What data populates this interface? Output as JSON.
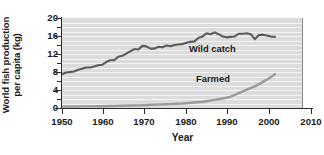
{
  "axes": {
    "ylabel_line1": "World fish production",
    "ylabel_line2": "per capita (kg)",
    "xlabel": "Year",
    "yticks": [
      0,
      4,
      8,
      12,
      16,
      20
    ],
    "xticks": [
      1950,
      1960,
      1970,
      1980,
      1990,
      2000,
      2010
    ]
  },
  "annotations": {
    "wild": "Wild catch",
    "farmed": "Farmed"
  },
  "colors": {
    "plot_background": "#dcdcdc",
    "gridline": "#f4f4f4",
    "wild_catch_line": "#5a5a5a",
    "farmed_line": "#9a9a9a",
    "axis": "#2b2b2b",
    "text": "#1a1a1a"
  },
  "chart_data": {
    "type": "line",
    "title": "",
    "xlabel": "Year",
    "ylabel": "World fish production per capita (kg)",
    "xlim": [
      1950,
      2010
    ],
    "ylim": [
      0,
      20
    ],
    "xticks": [
      1950,
      1960,
      1970,
      1980,
      1990,
      2000,
      2010
    ],
    "yticks": [
      0,
      4,
      8,
      12,
      16,
      20
    ],
    "grid": "horizontal gridlines every 1 kg, white on gray panel",
    "legend": "inline annotations next to each curve",
    "units": "kg per capita per year",
    "series": [
      {
        "name": "Wild catch",
        "color": "#5a5a5a",
        "label_position": "inside-right-center",
        "x": [
          1950,
          1951,
          1952,
          1953,
          1954,
          1955,
          1956,
          1957,
          1958,
          1959,
          1960,
          1961,
          1962,
          1963,
          1964,
          1965,
          1966,
          1967,
          1968,
          1969,
          1970,
          1971,
          1972,
          1973,
          1974,
          1975,
          1976,
          1977,
          1978,
          1979,
          1980,
          1981,
          1982,
          1983,
          1984,
          1985,
          1986,
          1987,
          1988,
          1989,
          1990,
          1991,
          1992,
          1993,
          1994,
          1995,
          1996,
          1997,
          1998,
          1999,
          2000,
          2001,
          2002,
          2003
        ],
        "values": [
          7.5,
          7.9,
          8.0,
          8.1,
          8.5,
          8.7,
          9.0,
          9.0,
          9.2,
          9.5,
          9.6,
          10.2,
          10.6,
          10.6,
          11.4,
          11.6,
          12.1,
          12.6,
          13.1,
          13.0,
          13.8,
          13.7,
          13.2,
          13.2,
          13.6,
          13.5,
          13.9,
          13.7,
          14.0,
          14.1,
          14.2,
          14.5,
          14.7,
          14.8,
          15.6,
          15.9,
          16.6,
          16.4,
          16.8,
          16.4,
          15.9,
          15.7,
          15.8,
          15.9,
          16.5,
          16.5,
          16.6,
          16.4,
          15.3,
          16.2,
          16.3,
          16.1,
          15.9,
          15.8
        ]
      },
      {
        "name": "Farmed",
        "color": "#9a9a9a",
        "label_position": "above-curve-right",
        "x": [
          1950,
          1955,
          1960,
          1965,
          1970,
          1975,
          1980,
          1985,
          1988,
          1990,
          1992,
          1994,
          1996,
          1998,
          2000,
          2001,
          2002,
          2003
        ],
        "values": [
          0.3,
          0.35,
          0.4,
          0.5,
          0.6,
          0.8,
          1.0,
          1.4,
          1.8,
          2.1,
          2.5,
          3.3,
          4.1,
          4.8,
          5.8,
          6.3,
          6.9,
          7.5
        ]
      }
    ]
  }
}
